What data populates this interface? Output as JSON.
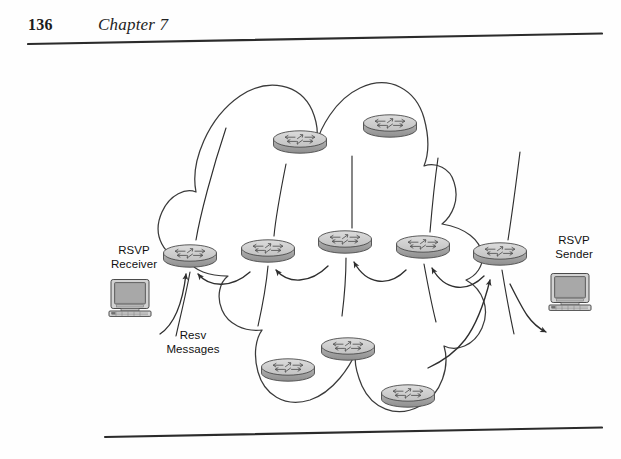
{
  "page": {
    "folio": "136",
    "chapter": "Chapter 7",
    "background_color": "#fefefe",
    "rule_color": "#2b2b2b"
  },
  "figure": {
    "name": "rsvp-resv-message-flow-diagram",
    "cloud": {
      "label": "network-cloud",
      "stroke": "#3a3a3a",
      "fill": "#ffffff"
    },
    "labels": {
      "receiver": "RSVP\nReceiver",
      "sender": "RSVP\nSender",
      "messages": "Resv\nMessages"
    },
    "hosts": [
      {
        "id": "receiver-host",
        "name": "rsvp-receiver-computer",
        "x": 108,
        "y": 234
      },
      {
        "id": "sender-host",
        "name": "rsvp-sender-computer",
        "x": 548,
        "y": 228
      }
    ],
    "routers": [
      {
        "id": "r-edge-left",
        "row": "middle",
        "x": 190,
        "y": 210,
        "scale": 1.0
      },
      {
        "id": "r-mid-2",
        "row": "middle",
        "x": 268,
        "y": 205,
        "scale": 1.0
      },
      {
        "id": "r-mid-3",
        "row": "middle",
        "x": 345,
        "y": 196,
        "scale": 1.0
      },
      {
        "id": "r-mid-4",
        "row": "middle",
        "x": 423,
        "y": 201,
        "scale": 1.0
      },
      {
        "id": "r-edge-right",
        "row": "middle",
        "x": 500,
        "y": 208,
        "scale": 1.0
      },
      {
        "id": "r-top-left",
        "row": "top",
        "x": 300,
        "y": 96,
        "scale": 1.0
      },
      {
        "id": "r-top-right",
        "row": "top",
        "x": 390,
        "y": 80,
        "scale": 1.0
      },
      {
        "id": "r-bot-left",
        "row": "bottom",
        "x": 288,
        "y": 324,
        "scale": 1.0
      },
      {
        "id": "r-bot-mid",
        "row": "bottom",
        "x": 348,
        "y": 303,
        "scale": 1.0
      },
      {
        "id": "r-bot-right",
        "row": "bottom",
        "x": 408,
        "y": 350,
        "scale": 1.0
      }
    ],
    "arrows": [
      {
        "id": "arrow-host-to-edge-left",
        "from": "receiver-host",
        "to": "r-edge-left",
        "direction": "right-to-left"
      },
      {
        "id": "arrow-mid2-to-edge-left",
        "from": "r-mid-2",
        "to": "r-edge-left"
      },
      {
        "id": "arrow-mid3-to-mid2",
        "from": "r-mid-3",
        "to": "r-mid-2"
      },
      {
        "id": "arrow-mid4-to-mid3",
        "from": "r-mid-4",
        "to": "r-mid-3"
      },
      {
        "id": "arrow-edgeright-to-mid4",
        "from": "r-edge-right",
        "to": "r-mid-4"
      },
      {
        "id": "arrow-botright-to-edgeright",
        "from": "r-bot-right",
        "to": "r-edge-right"
      },
      {
        "id": "arrow-edgeright-to-sender",
        "from": "r-edge-right",
        "to": "sender-host"
      }
    ],
    "colors": {
      "router_top": "#c9c9c9",
      "router_side": "#a6a6a6",
      "router_outline": "#4a4a4a",
      "monitor_body": "#d2d2d2",
      "monitor_screen": "#9a9a9a",
      "line": "#2e2e2e"
    }
  }
}
